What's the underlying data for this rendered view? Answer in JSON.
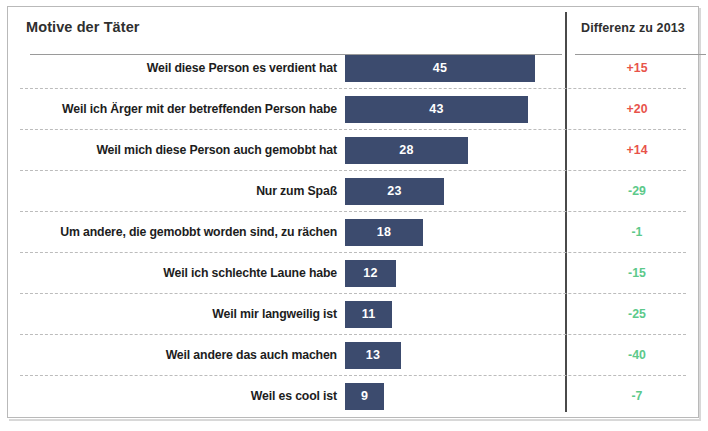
{
  "header": {
    "title": "Motive der Täter",
    "diff_column_label": "Differenz zu 2013"
  },
  "colors": {
    "bar": "#3c4b6e",
    "positive": "#e8534a",
    "negative": "#5cc98a",
    "frame": "#b9b9b9",
    "divider": "#4a4a4a"
  },
  "chart_data": {
    "type": "bar",
    "orientation": "horizontal",
    "title": "Motive der Täter",
    "xlabel": "",
    "ylabel": "",
    "grid": false,
    "legend": false,
    "xlim": [
      0,
      52
    ],
    "categories": [
      "Weil diese Person es verdient hat",
      "Weil ich Ärger mit der betreffenden Person habe",
      "Weil mich diese Person auch gemobbt hat",
      "Nur zum Spaß",
      "Um andere, die gemobbt worden sind, zu rächen",
      "Weil ich schlechte Laune habe",
      "Weil mir langweilig ist",
      "Weil andere das auch machen",
      "Weil es cool ist"
    ],
    "values": [
      45,
      43,
      28,
      23,
      18,
      12,
      11,
      13,
      9
    ],
    "value_labels": [
      "45",
      "43",
      "28",
      "23",
      "18",
      "12",
      "11",
      "13",
      "9"
    ],
    "series": [
      {
        "name": "Motive der Täter",
        "values": [
          45,
          43,
          28,
          23,
          18,
          12,
          11,
          13,
          9
        ]
      },
      {
        "name": "Differenz zu 2013",
        "values": [
          15,
          20,
          14,
          -29,
          -1,
          -15,
          -25,
          -40,
          -7
        ],
        "labels": [
          "+15",
          "+20",
          "+14",
          "-29",
          "-1",
          "-15",
          "-25",
          "-40",
          "-7"
        ]
      }
    ]
  },
  "rows": [
    {
      "label": "Weil diese Person es verdient hat",
      "value": 45,
      "value_label": "45",
      "bar_px": 190,
      "diff": "+15",
      "diff_sign": "positive"
    },
    {
      "label": "Weil ich Ärger mit der betreffenden Person habe",
      "value": 43,
      "value_label": "43",
      "bar_px": 183,
      "diff": "+20",
      "diff_sign": "positive"
    },
    {
      "label": "Weil mich diese Person auch gemobbt hat",
      "value": 28,
      "value_label": "28",
      "bar_px": 123,
      "diff": "+14",
      "diff_sign": "positive"
    },
    {
      "label": "Nur zum Spaß",
      "value": 23,
      "value_label": "23",
      "bar_px": 99,
      "diff": "-29",
      "diff_sign": "negative"
    },
    {
      "label": "Um andere, die gemobbt worden sind, zu rächen",
      "value": 18,
      "value_label": "18",
      "bar_px": 78,
      "diff": "-1",
      "diff_sign": "negative"
    },
    {
      "label": "Weil ich schlechte Laune habe",
      "value": 12,
      "value_label": "12",
      "bar_px": 51,
      "diff": "-15",
      "diff_sign": "negative"
    },
    {
      "label": "Weil mir langweilig ist",
      "value": 11,
      "value_label": "11",
      "bar_px": 47,
      "diff": "-25",
      "diff_sign": "negative"
    },
    {
      "label": "Weil andere das auch machen",
      "value": 13,
      "value_label": "13",
      "bar_px": 56,
      "diff": "-40",
      "diff_sign": "negative"
    },
    {
      "label": "Weil es cool ist",
      "value": 9,
      "value_label": "9",
      "bar_px": 39,
      "diff": "-7",
      "diff_sign": "negative"
    }
  ]
}
